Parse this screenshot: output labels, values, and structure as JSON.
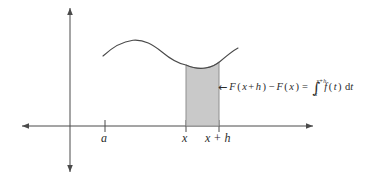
{
  "figure": {
    "name": "fundamental-theorem-of-calculus-diagram",
    "background_color": "#ffffff",
    "stroke_color": "#3a3a3a",
    "shaded_fill": "#c9c9c9",
    "shaded_stroke": "#8a8a8a",
    "width": 387,
    "height": 180
  },
  "axes": {
    "x_axis": {
      "y": 126,
      "x_start": 22,
      "x_end": 313,
      "arrow_start": true,
      "arrow_end": true
    },
    "y_axis": {
      "x": 70,
      "y_start": 8,
      "y_end": 172,
      "arrow_start": true,
      "arrow_end": true
    },
    "ticks": [
      {
        "label": "a",
        "x": 105
      },
      {
        "label": "x",
        "x": 186
      },
      {
        "label": "x + h",
        "x": 219
      }
    ]
  },
  "labels": {
    "a": "a",
    "x": "x",
    "x_plus_h": "x + h"
  },
  "curve": {
    "description": "function graph f(t)",
    "points": [
      [
        103,
        56
      ],
      [
        115,
        46
      ],
      [
        127,
        41
      ],
      [
        139,
        40
      ],
      [
        152,
        45
      ],
      [
        165,
        54
      ],
      [
        178,
        61
      ],
      [
        186,
        65
      ],
      [
        196,
        68
      ],
      [
        206,
        68
      ],
      [
        214,
        65
      ],
      [
        219,
        62
      ],
      [
        228,
        55
      ],
      [
        238,
        48
      ]
    ]
  },
  "shaded_region": {
    "description": "area under curve from x to x+h",
    "x_left": 186,
    "x_right": 219,
    "y_bottom": 126,
    "top_curve": [
      [
        186,
        65
      ],
      [
        192,
        67.5
      ],
      [
        198,
        68.5
      ],
      [
        205,
        68
      ],
      [
        212,
        65.5
      ],
      [
        219,
        62
      ]
    ]
  },
  "annotation": {
    "arrow_glyph": "←",
    "expression_parts": {
      "F1": "F",
      "open1": "(",
      "x1": "x",
      "plus": "+",
      "h1": "h",
      "close1": ")",
      "minus": "−",
      "F2": "F",
      "open2": "(",
      "x2": "x",
      "close2": ")",
      "equals": "=",
      "integral": "∫",
      "upper_limit": "x+h",
      "lower_limit": "x",
      "integrand": "f",
      "open3": "(",
      "t": "t",
      "close3": ")",
      "d": "d",
      "dvar": "t"
    },
    "plain_text": "F(x + h) − F(x) = ∫ from x to x+h of f(t) dt"
  }
}
